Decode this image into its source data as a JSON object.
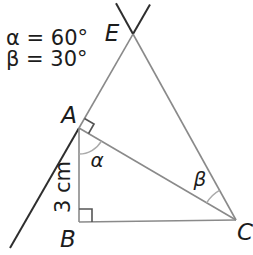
{
  "diagram": {
    "given": {
      "line1": "α = 60°",
      "line2": "β = 30°"
    },
    "vertex_labels": {
      "E": "E",
      "A": "A",
      "B": "B",
      "C": "C"
    },
    "angle_labels": {
      "alpha": "α",
      "beta": "β"
    },
    "side_label": "3 cm",
    "values": {
      "alpha_degrees": 60,
      "beta_degrees": 30,
      "side_AB_cm": 3
    },
    "colors": {
      "dark_line": "#2e2e2e",
      "gray_line": "#8a8a8a",
      "arc_line": "#ababab",
      "mark_line": "#555555",
      "text": "#1c1c1c",
      "background": "#ffffff"
    }
  }
}
